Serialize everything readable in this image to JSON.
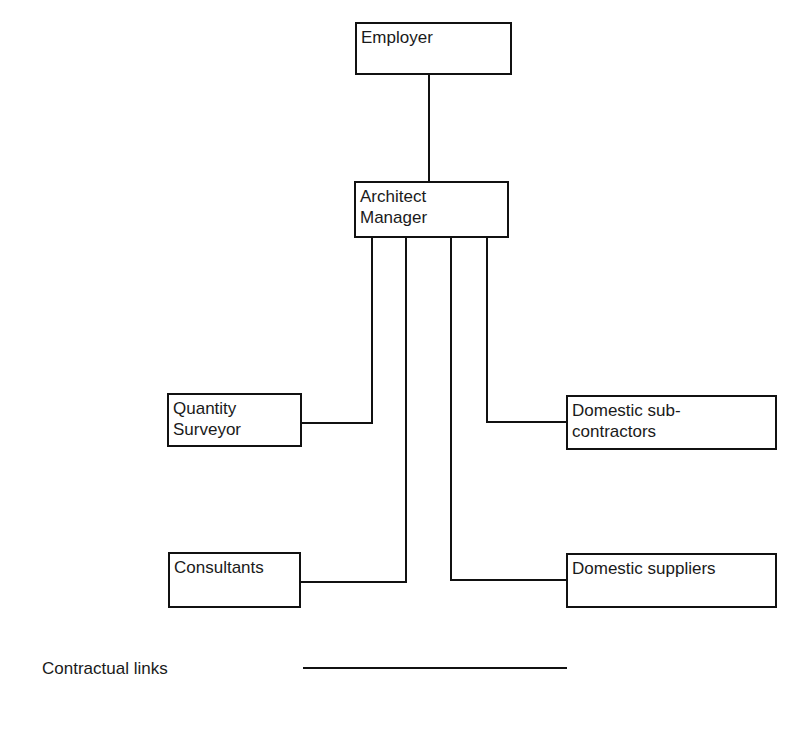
{
  "diagram": {
    "type": "organisation-chart",
    "nodes": {
      "employer": {
        "label": "Employer"
      },
      "architect": {
        "label": "Architect\nManager",
        "lines": [
          "Architect",
          "Manager"
        ]
      },
      "quantity_surveyor": {
        "label": "Quantity Surveyor",
        "lines": [
          "Quantity",
          "Surveyor"
        ]
      },
      "domestic_subcontractors": {
        "label": "Domestic sub-contractors",
        "lines": [
          "Domestic sub-",
          "contractors"
        ]
      },
      "consultants": {
        "label": "Consultants"
      },
      "domestic_suppliers": {
        "label": "Domestic suppliers"
      }
    },
    "edges": [
      {
        "from": "employer",
        "to": "architect",
        "type": "contractual"
      },
      {
        "from": "architect",
        "to": "quantity_surveyor",
        "type": "contractual"
      },
      {
        "from": "architect",
        "to": "consultants",
        "type": "contractual"
      },
      {
        "from": "architect",
        "to": "domestic_suppliers",
        "type": "contractual"
      },
      {
        "from": "architect",
        "to": "domestic_subcontractors",
        "type": "contractual"
      }
    ],
    "legend": {
      "label": "Contractual links",
      "line_style": "solid"
    },
    "colors": {
      "line": "#111111",
      "text": "#1a1a1a",
      "background": "#ffffff"
    }
  }
}
